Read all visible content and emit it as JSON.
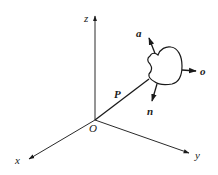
{
  "diagram": {
    "type": "3d-coordinate-frame",
    "origin": {
      "label": "O",
      "x": 95,
      "y": 120
    },
    "axes": [
      {
        "name": "z",
        "label": "z",
        "tip": [
          95,
          15
        ],
        "label_pos": [
          86,
          22
        ]
      },
      {
        "name": "x",
        "label": "x",
        "tip": [
          28,
          160
        ],
        "label_pos": [
          17,
          164
        ]
      },
      {
        "name": "y",
        "label": "y",
        "tip": [
          190,
          153
        ],
        "label_pos": [
          196,
          158
        ]
      }
    ],
    "position_vector": {
      "label": "P",
      "from": [
        95,
        120
      ],
      "to": [
        148,
        79
      ],
      "label_pos": [
        116,
        98
      ]
    },
    "object": {
      "description": "irregular rigid body"
    },
    "orientation_vectors": [
      {
        "name": "a",
        "label": "a",
        "from": [
          156,
          55
        ],
        "to": [
          148,
          37
        ],
        "label_pos": [
          138,
          37
        ]
      },
      {
        "name": "o",
        "label": "o",
        "from": [
          182,
          70
        ],
        "to": [
          196,
          71
        ],
        "label_pos": [
          201,
          75
        ]
      },
      {
        "name": "n",
        "label": "n",
        "from": [
          157,
          84
        ],
        "to": [
          152,
          100
        ],
        "label_pos": [
          148,
          115
        ]
      }
    ],
    "colors": {
      "stroke": "#1a1a1a",
      "background": "#ffffff"
    }
  }
}
